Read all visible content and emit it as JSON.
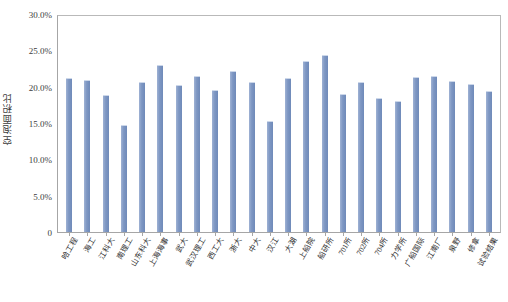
{
  "chart_data": {
    "type": "bar",
    "title": "",
    "xlabel": "",
    "ylabel": "空泡面积比",
    "ylim": [
      0,
      30
    ],
    "ytick_labels": [
      "30.0%",
      "25.0%",
      "20.0%",
      "15.0%",
      "10.0%",
      "5.0%",
      "0"
    ],
    "ytick_values": [
      30,
      25,
      20,
      15,
      10,
      5,
      0
    ],
    "yaxis_unit": "%",
    "grid": false,
    "legend": false,
    "bar_color": "#7e97c3",
    "categories": [
      "哈工程",
      "海工",
      "江科大",
      "南理工",
      "山东科大",
      "上海海事",
      "武大",
      "武汉理工",
      "西工大",
      "浙大",
      "中大",
      "汉江",
      "大湖",
      "上船院",
      "船研所",
      "701所",
      "702所",
      "704所",
      "力学所",
      "广船国际",
      "江南厂",
      "泉野",
      "修拿",
      "试验结果"
    ],
    "values": [
      21.0,
      20.8,
      18.7,
      14.6,
      20.5,
      22.8,
      20.1,
      21.3,
      19.4,
      22.0,
      20.5,
      15.1,
      21.1,
      23.4,
      24.2,
      18.8,
      20.5,
      18.3,
      17.9,
      21.2,
      21.4,
      20.7,
      20.2,
      19.2
    ]
  }
}
